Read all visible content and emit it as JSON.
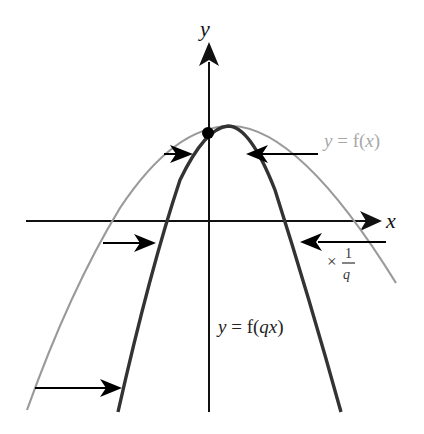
{
  "diagram": {
    "axes": {
      "x_label": "x",
      "y_label": "y"
    },
    "curves": [
      {
        "name": "original",
        "label": "y = f(x)",
        "label_parts": {
          "lhs": "y",
          "eq": " = f(",
          "var": "x",
          "close": ")"
        },
        "color": "#9a9a9a"
      },
      {
        "name": "transformed",
        "label": "y = f(qx)",
        "label_parts": {
          "lhs": "y",
          "eq": " = f(",
          "var": "qx",
          "close": ")"
        },
        "color": "#333333"
      }
    ],
    "annotation": {
      "times": "×",
      "numerator": "1",
      "denominator": "q"
    },
    "point_color": "#000000",
    "arrow_color": "#000000"
  }
}
